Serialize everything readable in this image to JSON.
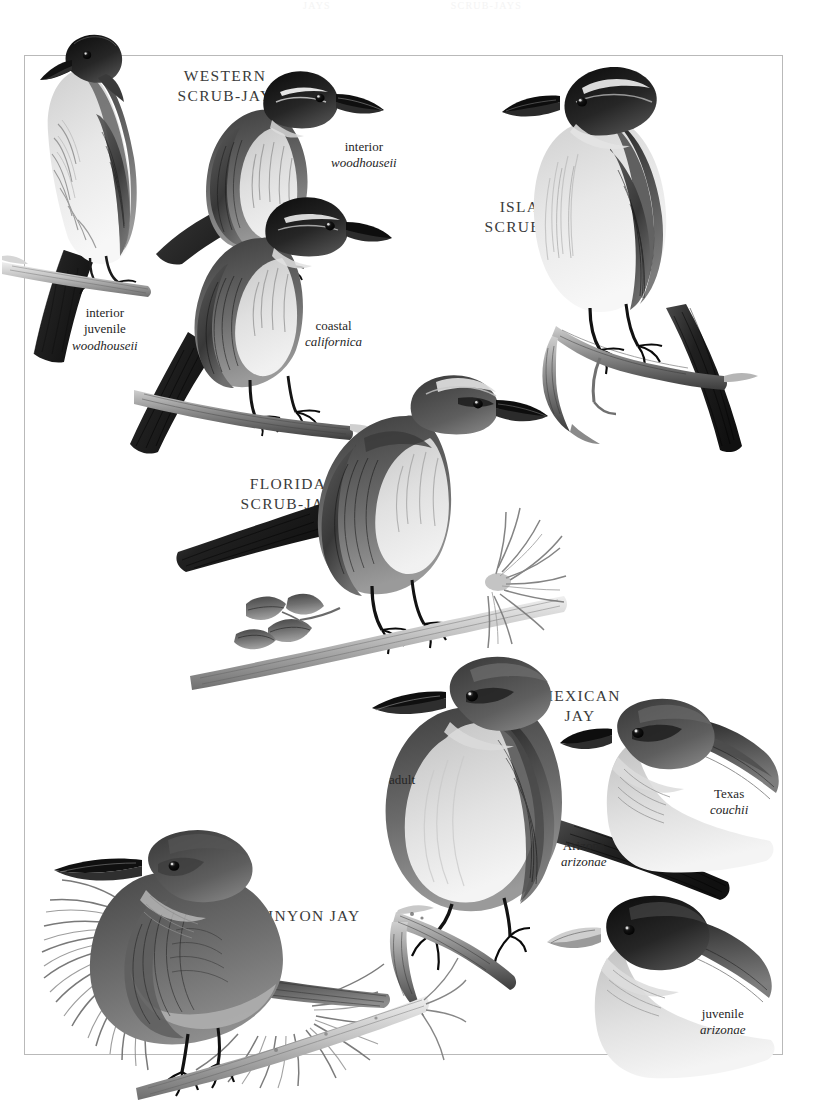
{
  "page": {
    "running_head_left": "JAYS",
    "running_head_right": "SCRUB-JAYS",
    "frame_color": "#b9b9b9",
    "background": "#ffffff",
    "ink": "#2a2a2a"
  },
  "plates": [
    {
      "id": "western-scrub-jay",
      "species_label": {
        "line1": "WESTERN",
        "line2": "SCRUB-JAY"
      },
      "figures": [
        {
          "id": "western-interior-woodhouseii",
          "caption": {
            "line1": "interior",
            "sci": "woodhouseii"
          }
        },
        {
          "id": "western-interior-juvenile",
          "caption": {
            "line1": "interior",
            "line2": "juvenile",
            "sci": "woodhouseii"
          }
        },
        {
          "id": "western-coastal-californica",
          "caption": {
            "line1": "coastal",
            "sci": "californica"
          }
        }
      ]
    },
    {
      "id": "island-scrub-jay",
      "species_label": {
        "line1": "ISLAND",
        "line2": "SCRUB-JAY"
      },
      "figures": []
    },
    {
      "id": "florida-scrub-jay",
      "species_label": {
        "line1": "FLORIDA",
        "line2": "SCRUB-JAY"
      },
      "figures": []
    },
    {
      "id": "mexican-jay",
      "species_label": {
        "line1": "MEXICAN",
        "line2": "JAY"
      },
      "figures": [
        {
          "id": "mexican-adult",
          "caption": {
            "line1": "adult"
          }
        },
        {
          "id": "mexican-arizona",
          "caption": {
            "line1": "Arizona",
            "sci": "arizonae"
          }
        },
        {
          "id": "mexican-texas",
          "caption": {
            "line1": "Texas",
            "sci": "couchii"
          }
        },
        {
          "id": "mexican-juvenile",
          "caption": {
            "line1": "juvenile",
            "sci": "arizonae"
          }
        }
      ]
    },
    {
      "id": "pinyon-jay",
      "species_label": {
        "line1": "PINYON JAY"
      },
      "figures": []
    }
  ],
  "labels": {
    "western_title_l1": "WESTERN",
    "western_title_l2": "SCRUB-JAY",
    "western_interior_l1": "interior",
    "western_interior_sci": "woodhouseii",
    "western_juv_l1": "interior",
    "western_juv_l2": "juvenile",
    "western_juv_sci": "woodhouseii",
    "western_coastal_l1": "coastal",
    "western_coastal_sci": "californica",
    "island_title_l1": "ISLAND",
    "island_title_l2": "SCRUB-JAY",
    "florida_title_l1": "FLORIDA",
    "florida_title_l2": "SCRUB-JAY",
    "mexican_title_l1": "MEXICAN",
    "mexican_title_l2": "JAY",
    "mexican_adult": "adult",
    "mexican_arizona_l1": "Arizona",
    "mexican_arizona_sci": "arizonae",
    "mexican_texas_l1": "Texas",
    "mexican_texas_sci": "couchii",
    "mexican_juv_l1": "juvenile",
    "mexican_juv_sci": "arizonae",
    "pinyon_title": "PINYON JAY"
  }
}
